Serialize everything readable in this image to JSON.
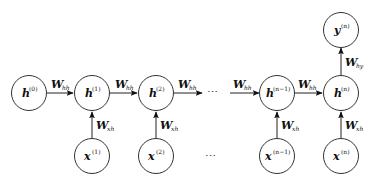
{
  "diagram": {
    "type": "unrolled-rnn",
    "nodes": {
      "h0": {
        "base": "h",
        "sup": "(0)"
      },
      "h1": {
        "base": "h",
        "sup": "(1)"
      },
      "h2": {
        "base": "h",
        "sup": "(2)"
      },
      "hn1": {
        "base": "h",
        "sup": "(n−1)"
      },
      "hn": {
        "base": "h",
        "sup": "(n)"
      },
      "x1": {
        "base": "x",
        "sup": "(1)"
      },
      "x2": {
        "base": "x",
        "sup": "(2)"
      },
      "xn1": {
        "base": "x",
        "sup": "(n−1)"
      },
      "xn": {
        "base": "x",
        "sup": "(n)"
      },
      "yn": {
        "base": "y",
        "sup": "(n)"
      }
    },
    "edges": {
      "hh": {
        "base": "W",
        "sub": "hh"
      },
      "xh": {
        "base": "W",
        "sub": "xh"
      },
      "hy": {
        "base": "W",
        "sub": "hy"
      }
    },
    "ellipsis": "⋯",
    "edge_list": [
      {
        "from": "h0",
        "to": "h1",
        "label": "W_hh"
      },
      {
        "from": "h1",
        "to": "h2",
        "label": "W_hh"
      },
      {
        "from": "h2",
        "to": "…",
        "label": "W_hh"
      },
      {
        "from": "…",
        "to": "hn1",
        "label": "W_hh"
      },
      {
        "from": "hn1",
        "to": "hn",
        "label": "W_hh"
      },
      {
        "from": "x1",
        "to": "h1",
        "label": "W_xh"
      },
      {
        "from": "x2",
        "to": "h2",
        "label": "W_xh"
      },
      {
        "from": "xn1",
        "to": "hn1",
        "label": "W_xh"
      },
      {
        "from": "xn",
        "to": "hn",
        "label": "W_xh"
      },
      {
        "from": "hn",
        "to": "yn",
        "label": "W_hy"
      }
    ]
  }
}
